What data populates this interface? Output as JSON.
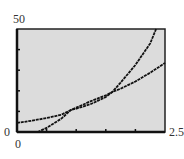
{
  "chart_data": {
    "type": "line",
    "title": "",
    "xlabel": "",
    "ylabel": "",
    "xlim": [
      0,
      2.5
    ],
    "ylim": [
      0,
      50
    ],
    "x_tick_labels": [
      "0",
      "2.5"
    ],
    "y_tick_labels": [
      "0",
      "50"
    ],
    "x_ticks": [
      0.5,
      1.0,
      1.5,
      2.0
    ],
    "y_ticks": [
      10,
      20,
      30,
      40
    ],
    "grid": false,
    "background": "#dcdcdc",
    "series": [
      {
        "name": "curve-1-gentle",
        "x": [
          0,
          0.25,
          0.5,
          0.75,
          0.91,
          1.0,
          1.25,
          1.5,
          1.61,
          1.75,
          2.0,
          2.25,
          2.5
        ],
        "values": [
          4.4,
          5.5,
          6.8,
          8.4,
          10.7,
          11.3,
          13.6,
          17.0,
          19.4,
          21.0,
          24.5,
          28.8,
          33.5
        ]
      },
      {
        "name": "curve-2-steep",
        "x": [
          0.35,
          0.5,
          0.75,
          0.91,
          1.0,
          1.25,
          1.5,
          1.61,
          1.75,
          2.0,
          2.25,
          2.35
        ],
        "values": [
          0,
          2.0,
          6.5,
          10.7,
          11.8,
          15.0,
          17.8,
          19.4,
          24.0,
          32.5,
          43.0,
          50
        ]
      }
    ]
  },
  "labels": {
    "y_max": "50",
    "y_min": "0",
    "x_min": "0",
    "x_max": "2.5"
  }
}
